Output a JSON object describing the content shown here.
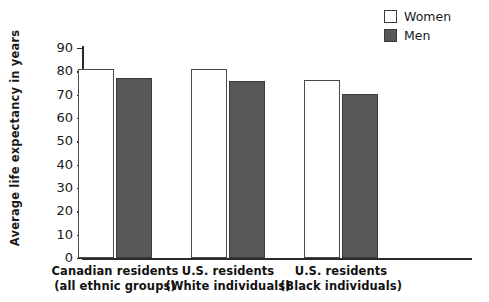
{
  "chart_data": {
    "type": "bar",
    "title": "",
    "subtitle": "",
    "xlabel": "",
    "ylabel": "Average life expectancy in years",
    "ylim": [
      0,
      90
    ],
    "ytick_step": 10,
    "yticks": [
      90,
      80,
      70,
      60,
      50,
      40,
      30,
      20,
      10,
      0
    ],
    "grid": false,
    "legend_position": "top-right",
    "categories": [
      "Canadian residents (all ethnic groups)",
      "U.S. residents (White individuals)",
      "U.S. residents (Black individuals)"
    ],
    "category_lines": [
      [
        "Canadian residents",
        "(all ethnic groups)"
      ],
      [
        "U.S. residents",
        "(White individuals)"
      ],
      [
        "U.S. residents",
        "(Black individuals)"
      ]
    ],
    "series": [
      {
        "name": "Women",
        "color": "#ffffff",
        "values": [
          81,
          81,
          76.5
        ]
      },
      {
        "name": "Men",
        "color": "#58585a",
        "values": [
          77,
          76,
          70.5
        ]
      }
    ]
  },
  "legend": {
    "items": [
      {
        "label": "Women",
        "swatch": "women-swatch"
      },
      {
        "label": "Men",
        "swatch": "men-swatch"
      }
    ]
  },
  "axes": {
    "y_title": "Average life expectancy in years",
    "y_tick_labels": [
      "90",
      "80",
      "70",
      "60",
      "50",
      "40",
      "30",
      "20",
      "10",
      "0"
    ]
  },
  "colors": {
    "women_fill": "#ffffff",
    "men_fill": "#58585a",
    "axis": "#2b2b2b",
    "text": "#1a1a1a",
    "background": "#ffffff"
  }
}
